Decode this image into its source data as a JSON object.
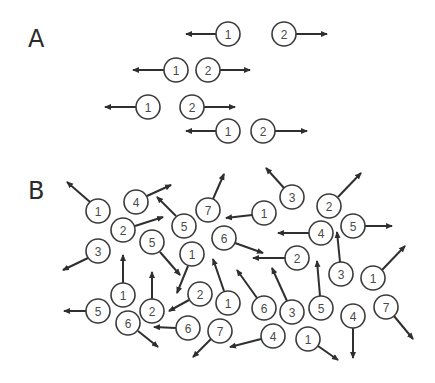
{
  "colors": {
    "stroke": "#3a3a3a",
    "arrow": "#2f2f2f",
    "text": "#4a4a4a",
    "background": "#ffffff"
  },
  "circle_radius": 12,
  "panels": [
    {
      "label": "A",
      "label_pos": [
        28,
        47
      ],
      "particles": [
        {
          "n": "1",
          "cx": 228,
          "cy": 34,
          "arrow": [
            [
              216,
              34
            ],
            [
              186,
              34
            ]
          ]
        },
        {
          "n": "2",
          "cx": 284,
          "cy": 34,
          "arrow": [
            [
              296,
              34
            ],
            [
              327,
              34
            ]
          ]
        },
        {
          "n": "1",
          "cx": 176,
          "cy": 70,
          "arrow": [
            [
              164,
              70
            ],
            [
              133,
              70
            ]
          ]
        },
        {
          "n": "2",
          "cx": 208,
          "cy": 70,
          "arrow": [
            [
              220,
              70
            ],
            [
              250,
              70
            ]
          ]
        },
        {
          "n": "1",
          "cx": 148,
          "cy": 107,
          "arrow": [
            [
              136,
              107
            ],
            [
              105,
              107
            ]
          ]
        },
        {
          "n": "2",
          "cx": 192,
          "cy": 107,
          "arrow": [
            [
              204,
              107
            ],
            [
              235,
              107
            ]
          ]
        },
        {
          "n": "1",
          "cx": 228,
          "cy": 131,
          "arrow": [
            [
              216,
              131
            ],
            [
              186,
              131
            ]
          ]
        },
        {
          "n": "2",
          "cx": 263,
          "cy": 131,
          "arrow": [
            [
              275,
              131
            ],
            [
              307,
              131
            ]
          ]
        }
      ]
    },
    {
      "label": "B",
      "label_pos": [
        28,
        199
      ],
      "particles": [
        {
          "n": "1",
          "cx": 98,
          "cy": 211,
          "arrow": [
            [
              90,
              202
            ],
            [
              67,
              182
            ]
          ]
        },
        {
          "n": "4",
          "cx": 136,
          "cy": 202,
          "arrow": [
            [
              147,
              196
            ],
            [
              171,
              185
            ]
          ]
        },
        {
          "n": "2",
          "cx": 123,
          "cy": 230,
          "arrow": [
            [
              135,
              226
            ],
            [
              163,
              217
            ]
          ]
        },
        {
          "n": "3",
          "cx": 98,
          "cy": 251,
          "arrow": [
            [
              88,
              258
            ],
            [
              63,
              270
            ]
          ]
        },
        {
          "n": "5",
          "cx": 184,
          "cy": 226,
          "arrow": [
            [
              176,
              216
            ],
            [
              157,
              197
            ]
          ]
        },
        {
          "n": "5",
          "cx": 152,
          "cy": 242,
          "arrow": [
            [
              160,
              252
            ],
            [
              180,
              275
            ]
          ]
        },
        {
          "n": "7",
          "cx": 208,
          "cy": 210,
          "arrow": [
            [
              213,
              199
            ],
            [
              224,
              174
            ]
          ]
        },
        {
          "n": "1",
          "cx": 264,
          "cy": 213,
          "arrow": [
            [
              252,
              215
            ],
            [
              226,
              218
            ]
          ]
        },
        {
          "n": "6",
          "cx": 224,
          "cy": 238,
          "arrow": [
            [
              235,
              243
            ],
            [
              263,
              253
            ]
          ]
        },
        {
          "n": "1",
          "cx": 192,
          "cy": 254,
          "arrow": [
            [
              188,
              266
            ],
            [
              177,
              293
            ]
          ]
        },
        {
          "n": "3",
          "cx": 292,
          "cy": 197,
          "arrow": [
            [
              284,
              188
            ],
            [
              266,
              168
            ]
          ]
        },
        {
          "n": "2",
          "cx": 329,
          "cy": 206,
          "arrow": [
            [
              338,
              197
            ],
            [
              361,
              173
            ]
          ]
        },
        {
          "n": "4",
          "cx": 321,
          "cy": 233,
          "arrow": [
            [
              309,
              233
            ],
            [
              278,
              233
            ]
          ]
        },
        {
          "n": "5",
          "cx": 353,
          "cy": 226,
          "arrow": [
            [
              365,
              226
            ],
            [
              392,
              226
            ]
          ]
        },
        {
          "n": "2",
          "cx": 297,
          "cy": 258,
          "arrow": [
            [
              285,
              258
            ],
            [
              253,
              258
            ]
          ]
        },
        {
          "n": "3",
          "cx": 341,
          "cy": 274,
          "arrow": [
            [
              340,
              262
            ],
            [
              337,
              232
            ]
          ]
        },
        {
          "n": "1",
          "cx": 373,
          "cy": 278,
          "arrow": [
            [
              382,
              270
            ],
            [
              405,
              246
            ]
          ]
        },
        {
          "n": "1",
          "cx": 123,
          "cy": 295,
          "arrow": [
            [
              123,
              283
            ],
            [
              123,
              255
            ]
          ]
        },
        {
          "n": "2",
          "cx": 152,
          "cy": 311,
          "arrow": [
            [
              152,
              299
            ],
            [
              152,
              272
            ]
          ]
        },
        {
          "n": "2",
          "cx": 200,
          "cy": 294,
          "arrow": [
            [
              189,
              300
            ],
            [
              169,
              311
            ]
          ]
        },
        {
          "n": "5",
          "cx": 98,
          "cy": 311,
          "arrow": [
            [
              86,
              311
            ],
            [
              64,
              311
            ]
          ]
        },
        {
          "n": "6",
          "cx": 128,
          "cy": 323,
          "arrow": [
            [
              138,
              331
            ],
            [
              158,
              347
            ]
          ]
        },
        {
          "n": "6",
          "cx": 188,
          "cy": 328,
          "arrow": [
            [
              176,
              328
            ],
            [
              154,
              327
            ]
          ]
        },
        {
          "n": "1",
          "cx": 228,
          "cy": 303,
          "arrow": [
            [
              224,
              291
            ],
            [
              213,
              259
            ]
          ]
        },
        {
          "n": "6",
          "cx": 264,
          "cy": 308,
          "arrow": [
            [
              257,
              298
            ],
            [
              237,
              270
            ]
          ]
        },
        {
          "n": "3",
          "cx": 292,
          "cy": 312,
          "arrow": [
            [
              287,
              301
            ],
            [
              272,
              268
            ]
          ]
        },
        {
          "n": "5",
          "cx": 321,
          "cy": 308,
          "arrow": [
            [
              320,
              296
            ],
            [
              317,
              261
            ]
          ]
        },
        {
          "n": "7",
          "cx": 220,
          "cy": 331,
          "arrow": [
            [
              211,
              339
            ],
            [
              193,
              357
            ]
          ]
        },
        {
          "n": "4",
          "cx": 273,
          "cy": 336,
          "arrow": [
            [
              261,
              339
            ],
            [
              230,
              347
            ]
          ]
        },
        {
          "n": "1",
          "cx": 308,
          "cy": 339,
          "arrow": [
            [
              318,
              346
            ],
            [
              338,
              360
            ]
          ]
        },
        {
          "n": "4",
          "cx": 353,
          "cy": 316,
          "arrow": [
            [
              353,
              328
            ],
            [
              353,
              358
            ]
          ]
        },
        {
          "n": "7",
          "cx": 386,
          "cy": 307,
          "arrow": [
            [
              394,
              316
            ],
            [
              413,
              339
            ]
          ]
        }
      ]
    }
  ]
}
